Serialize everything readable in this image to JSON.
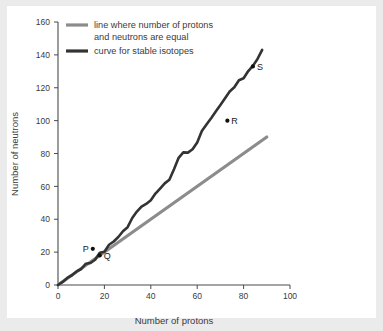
{
  "chart_data": {
    "type": "line",
    "title": "",
    "xlabel": "Number of protons",
    "ylabel": "Number of neutrons",
    "xlim": [
      0,
      100
    ],
    "ylim": [
      0,
      160
    ],
    "xticks": [
      0,
      20,
      40,
      60,
      80,
      100
    ],
    "yticks": [
      0,
      20,
      40,
      60,
      80,
      100,
      120,
      140,
      160
    ],
    "grid": false,
    "legend_position": "top-left-inside",
    "colors": {
      "equal_line": "#8c8c8c",
      "stable_curve": "#333333",
      "axis": "#4a4a4a",
      "text": "#3b3b3b",
      "background": "#ffffff",
      "edge_band": "#ebebeb"
    },
    "series": [
      {
        "name": "line where number of protons and neutrons are equal",
        "color": "#8c8c8c",
        "style": "straight-line",
        "x": [
          0,
          90
        ],
        "values": [
          0,
          90
        ]
      },
      {
        "name": "curve for stable isotopes",
        "color": "#333333",
        "style": "jagged-curve",
        "x": [
          0,
          2,
          4,
          6,
          8,
          10,
          12,
          14,
          16,
          18,
          20,
          22,
          24,
          26,
          28,
          30,
          32,
          34,
          36,
          38,
          40,
          42,
          44,
          46,
          48,
          50,
          52,
          54,
          56,
          58,
          60,
          62,
          64,
          66,
          68,
          70,
          72,
          74,
          76,
          78,
          80,
          82,
          84,
          86,
          88
        ],
        "values": [
          0,
          2,
          4,
          6,
          9,
          10,
          13,
          14,
          16,
          19,
          21,
          24,
          26,
          30,
          32,
          35,
          40,
          44,
          48,
          50,
          52,
          56,
          58,
          62,
          64,
          70,
          78,
          80,
          81,
          82,
          86,
          94,
          98,
          102,
          106,
          110,
          114,
          117,
          120,
          124,
          126,
          130,
          133,
          138,
          143
        ]
      }
    ],
    "points": [
      {
        "label": "P",
        "x": 15,
        "y": 22,
        "label_side": "left"
      },
      {
        "label": "Q",
        "x": 18,
        "y": 18,
        "label_side": "right"
      },
      {
        "label": "R",
        "x": 73,
        "y": 100,
        "label_side": "right"
      },
      {
        "label": "S",
        "x": 84,
        "y": 133,
        "label_side": "right"
      }
    ]
  },
  "legend": {
    "items": [
      {
        "label_line1": "line where number of protons",
        "label_line2": "and neutrons are equal",
        "color": "#8c8c8c"
      },
      {
        "label_line1": "curve for stable isotopes",
        "label_line2": "",
        "color": "#333333"
      }
    ]
  },
  "axes": {
    "x_title": "Number of protons",
    "y_title": "Number of neutrons",
    "x_tick_labels": [
      "0",
      "20",
      "40",
      "60",
      "80",
      "100"
    ],
    "y_tick_labels": [
      "0",
      "20",
      "40",
      "60",
      "80",
      "100",
      "120",
      "140",
      "160"
    ]
  }
}
